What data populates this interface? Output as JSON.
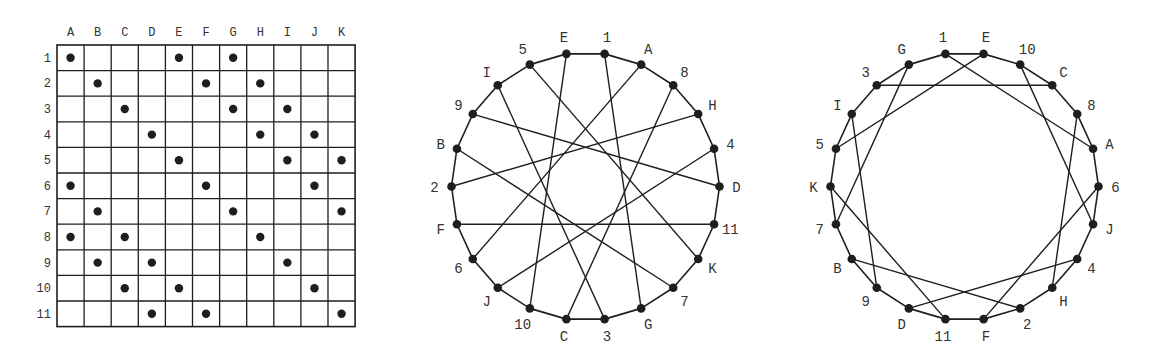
{
  "colors": {
    "ink": "#1e1e1e",
    "label": "#333333",
    "background": "#ffffff"
  },
  "grid": {
    "columns": [
      "A",
      "B",
      "C",
      "D",
      "E",
      "F",
      "G",
      "H",
      "I",
      "J",
      "K"
    ],
    "rows": [
      "1",
      "2",
      "3",
      "4",
      "5",
      "6",
      "7",
      "8",
      "9",
      "10",
      "11"
    ],
    "incidences": {
      "1": [
        "A",
        "E",
        "G"
      ],
      "2": [
        "B",
        "F",
        "H"
      ],
      "3": [
        "C",
        "G",
        "I"
      ],
      "4": [
        "D",
        "H",
        "J"
      ],
      "5": [
        "E",
        "I",
        "K"
      ],
      "6": [
        "A",
        "F",
        "J"
      ],
      "7": [
        "B",
        "G",
        "K"
      ],
      "8": [
        "A",
        "C",
        "H"
      ],
      "9": [
        "B",
        "D",
        "I"
      ],
      "10": [
        "C",
        "E",
        "J"
      ],
      "11": [
        "D",
        "F",
        "K"
      ]
    }
  },
  "graphs": [
    {
      "name": "levi-graph-left",
      "vertex_order_clockwise_from_top": [
        "E",
        "1",
        "A",
        "8",
        "H",
        "4",
        "D",
        "11",
        "K",
        "7",
        "G",
        "3",
        "C",
        "10",
        "J",
        "6",
        "F",
        "2",
        "B",
        "9",
        "I",
        "5"
      ],
      "chords": [
        [
          "1",
          "G"
        ],
        [
          "2",
          "H"
        ],
        [
          "3",
          "I"
        ],
        [
          "4",
          "J"
        ],
        [
          "5",
          "K"
        ],
        [
          "6",
          "A"
        ],
        [
          "7",
          "B"
        ],
        [
          "8",
          "C"
        ],
        [
          "9",
          "D"
        ],
        [
          "10",
          "E"
        ],
        [
          "11",
          "F"
        ]
      ]
    },
    {
      "name": "levi-graph-right",
      "vertex_order_clockwise_from_top": [
        "1",
        "E",
        "10",
        "C",
        "8",
        "A",
        "6",
        "J",
        "4",
        "H",
        "2",
        "F",
        "11",
        "D",
        "9",
        "B",
        "7",
        "K",
        "5",
        "I",
        "3",
        "G"
      ],
      "chords": [
        [
          "1",
          "A"
        ],
        [
          "2",
          "B"
        ],
        [
          "3",
          "C"
        ],
        [
          "4",
          "D"
        ],
        [
          "5",
          "E"
        ],
        [
          "6",
          "F"
        ],
        [
          "7",
          "G"
        ],
        [
          "8",
          "H"
        ],
        [
          "9",
          "I"
        ],
        [
          "10",
          "J"
        ],
        [
          "11",
          "K"
        ]
      ]
    }
  ]
}
